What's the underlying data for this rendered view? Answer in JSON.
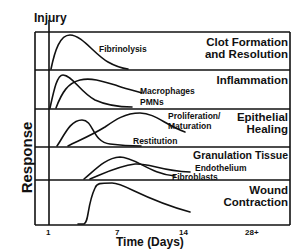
{
  "figure": {
    "injury_label": "Injury",
    "y_axis_label": "Response",
    "x_axis_label": "Time (Days)",
    "x_ticks": [
      "1",
      "7",
      "14",
      "28+"
    ]
  },
  "rows": [
    {
      "title_line1": "Clot Formation",
      "title_line2": "and Resolution",
      "curves": [
        "Fibrinolysis"
      ]
    },
    {
      "title_line1": "Inflammation",
      "title_line2": "",
      "curves": [
        "Macrophages",
        "PMNs"
      ]
    },
    {
      "title_line1": "Epithelial",
      "title_line2": "Healing",
      "curves": [
        "Proliferation/",
        "Maturation",
        "Restitution"
      ]
    },
    {
      "title_line1": "Granulation Tissue",
      "title_line2": "",
      "curves": [
        "Endothelium",
        "Fibroblasts"
      ]
    },
    {
      "title_line1": "Wound",
      "title_line2": "Contraction",
      "curves": []
    }
  ],
  "colors": {
    "ink": "#111111",
    "background": "#ffffff"
  }
}
